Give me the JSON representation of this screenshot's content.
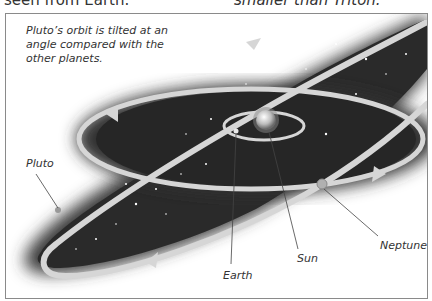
{
  "header": {
    "left_text_cut": "seen from Earth.",
    "right_text_cut": "smaller than Triton."
  },
  "diagram": {
    "caption": "Pluto’s orbit is tilted at an angle compared with the other planets.",
    "labels": {
      "pluto": "Pluto",
      "earth": "Earth",
      "sun": "Sun",
      "neptune": "Neptune"
    },
    "colors": {
      "space": "#2b2b2b",
      "orbit": "#d6d6d6",
      "frame_border": "#8a8a8a",
      "text": "#333333"
    }
  }
}
